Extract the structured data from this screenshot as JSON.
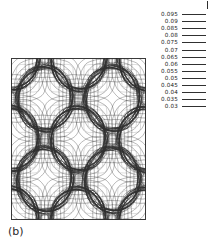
{
  "figure": {
    "panel_label": "(b)",
    "background_color": "#ffffff",
    "frame_color": "#3a3a3a",
    "contour_color": "#303030"
  },
  "legend": {
    "levels": [
      "0.095",
      "0.09",
      "0.085",
      "0.08",
      "0.075",
      "0.07",
      "0.065",
      "0.06",
      "0.055",
      "0.05",
      "0.045",
      "0.04",
      "0.035",
      "0.03"
    ]
  },
  "chart_data": {
    "type": "heatmap",
    "title": "",
    "subtitle": "",
    "xlabel": "",
    "ylabel": "",
    "annotations": [
      "(b)"
    ],
    "grid": false,
    "legend_position": "right",
    "legend_entries": [
      "0.095",
      "0.09",
      "0.085",
      "0.08",
      "0.075",
      "0.07",
      "0.065",
      "0.06",
      "0.055",
      "0.05",
      "0.045",
      "0.04",
      "0.035",
      "0.03"
    ],
    "contour_levels": [
      0.095,
      0.09,
      0.085,
      0.08,
      0.075,
      0.07,
      0.065,
      0.06,
      0.055,
      0.05,
      0.045,
      0.04,
      0.035,
      0.03
    ],
    "level_step": 0.005,
    "value_min": 0.03,
    "value_max": 0.095,
    "xlim": [
      0,
      1
    ],
    "ylim": [
      0,
      1
    ],
    "lattice": {
      "type": "centered-square",
      "large_circle_radius": 0.205,
      "large_circle_centers": [
        [
          0.0,
          0.0
        ],
        [
          0.5,
          0.0
        ],
        [
          1.0,
          0.0
        ],
        [
          0.0,
          0.5
        ],
        [
          0.5,
          0.5
        ],
        [
          1.0,
          0.5
        ],
        [
          0.0,
          1.0
        ],
        [
          0.5,
          1.0
        ],
        [
          1.0,
          1.0
        ],
        [
          0.25,
          0.25
        ],
        [
          0.75,
          0.25
        ],
        [
          0.25,
          0.75
        ],
        [
          0.75,
          0.75
        ]
      ],
      "interstitial_centers": [
        [
          0.0,
          0.25
        ],
        [
          0.5,
          0.25
        ],
        [
          1.0,
          0.25
        ],
        [
          0.25,
          0.0
        ],
        [
          0.75,
          0.0
        ],
        [
          0.25,
          0.5
        ],
        [
          0.75,
          0.5
        ],
        [
          0.0,
          0.75
        ],
        [
          0.5,
          0.75
        ],
        [
          1.0,
          0.75
        ],
        [
          0.25,
          1.0
        ],
        [
          0.75,
          1.0
        ]
      ]
    }
  }
}
